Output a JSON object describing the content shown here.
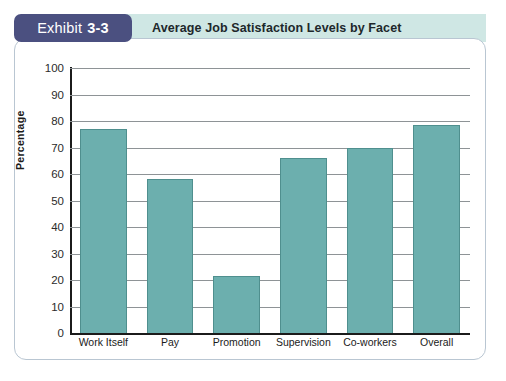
{
  "exhibit": {
    "tab_word": "Exhibit",
    "tab_number": "3-3",
    "title": "Average Job Satisfaction Levels by Facet",
    "tab_color": "#4b5080",
    "title_band_color": "#cfe7e4",
    "card_border_color": "#b9c6d2"
  },
  "chart_data": {
    "type": "bar",
    "title": "Average Job Satisfaction Levels by Facet",
    "xlabel": "",
    "ylabel": "Percentage",
    "ylim": [
      0,
      100
    ],
    "ytick_step": 10,
    "yticks": [
      "100",
      "90",
      "80",
      "70",
      "60",
      "50",
      "40",
      "30",
      "20",
      "10",
      "0"
    ],
    "grid": true,
    "legend": "none",
    "bar_color": "#6cafae",
    "bar_edge_color": "#4f8f8e",
    "categories": [
      "Work Itself",
      "Pay",
      "Promotion",
      "Supervision",
      "Co-workers",
      "Overall"
    ],
    "values": [
      77,
      58,
      21.5,
      66,
      70,
      78.5
    ]
  }
}
